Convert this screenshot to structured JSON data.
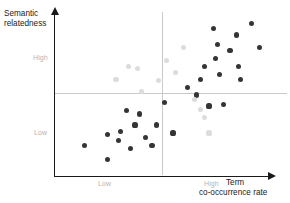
{
  "figure": {
    "background": "#ffffff",
    "plot_type": "scatter"
  },
  "axes": {
    "y_title_line1": "Semantic",
    "y_title_line2": "relatedness",
    "x_title_line1": "Term",
    "x_title_line2": "co-occurrence rate",
    "y_ticks": [
      "High",
      "Low"
    ],
    "x_ticks": [
      "Low",
      "High"
    ]
  },
  "colors": {
    "axis": "#1a1a1a",
    "divider": "#c9c9c9",
    "tick_text": "#b4b4b4",
    "title_text": "#1a1a1a",
    "series_dark": "#353535",
    "series_light": "#dcdcdc"
  },
  "chart_data": {
    "type": "scatter",
    "title": "",
    "xlabel": "Term co-occurrence rate",
    "ylabel": "Semantic relatedness",
    "xlim": [
      0,
      1
    ],
    "ylim": [
      0,
      1
    ],
    "grid": false,
    "legend": "none",
    "annotations": [
      {
        "type": "quadrant-divider",
        "orientation": "vertical",
        "x": 0.5
      },
      {
        "type": "quadrant-divider",
        "orientation": "horizontal",
        "y": 0.51
      }
    ],
    "axis_tick_labels": {
      "x": [
        {
          "label": "Low",
          "x": 0.21
        },
        {
          "label": "High",
          "x": 0.72
        }
      ],
      "y": [
        {
          "label": "High",
          "y": 0.74
        },
        {
          "label": "Low",
          "y": 0.29
        }
      ]
    },
    "series": [
      {
        "name": "dark-points",
        "color": "#353535",
        "points": [
          [
            0.13,
            0.18
          ],
          [
            0.24,
            0.09
          ],
          [
            0.24,
            0.25
          ],
          [
            0.29,
            0.21
          ],
          [
            0.3,
            0.27
          ],
          [
            0.33,
            0.4
          ],
          [
            0.35,
            0.16
          ],
          [
            0.37,
            0.31
          ],
          [
            0.39,
            0.38
          ],
          [
            0.42,
            0.23
          ],
          [
            0.45,
            0.18
          ],
          [
            0.47,
            0.31
          ],
          [
            0.51,
            0.45
          ],
          [
            0.55,
            0.26
          ],
          [
            0.62,
            0.55
          ],
          [
            0.66,
            0.5
          ],
          [
            0.68,
            0.6
          ],
          [
            0.7,
            0.68
          ],
          [
            0.72,
            0.43
          ],
          [
            0.74,
            0.92
          ],
          [
            0.75,
            0.73
          ],
          [
            0.76,
            0.82
          ],
          [
            0.77,
            0.63
          ],
          [
            0.79,
            0.44
          ],
          [
            0.82,
            0.78
          ],
          [
            0.85,
            0.88
          ],
          [
            0.86,
            0.68
          ],
          [
            0.87,
            0.6
          ],
          [
            0.92,
            0.95
          ],
          [
            0.96,
            0.8
          ]
        ]
      },
      {
        "name": "light-points",
        "color": "#dcdcdc",
        "points": [
          [
            0.28,
            0.6
          ],
          [
            0.34,
            0.68
          ],
          [
            0.38,
            0.67
          ],
          [
            0.4,
            0.52
          ],
          [
            0.48,
            0.59
          ],
          [
            0.52,
            0.72
          ],
          [
            0.56,
            0.64
          ],
          [
            0.6,
            0.8
          ],
          [
            0.65,
            0.47
          ],
          [
            0.68,
            0.41
          ],
          [
            0.7,
            0.36
          ],
          [
            0.72,
            0.26
          ]
        ]
      }
    ]
  }
}
